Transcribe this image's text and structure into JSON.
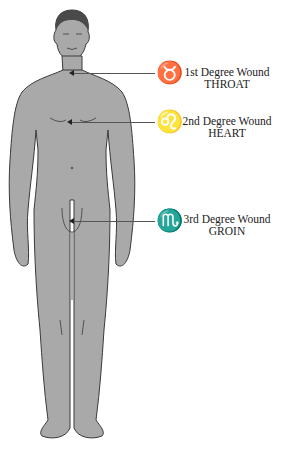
{
  "diagram": {
    "type": "anatomical-figure",
    "figure": "standing male human body, front view",
    "colors": {
      "body_fill": "#a9a9a9",
      "outline": "#3a3a3a",
      "hair": "#4a4a4a",
      "pointer_line": "#555555",
      "text": "#222222"
    },
    "annotations": [
      {
        "id": "throat",
        "symbol": "♉",
        "symbol_name": "taurus",
        "line1": "1st Degree Wound",
        "line2": "THROAT",
        "pointer_y": 73
      },
      {
        "id": "heart",
        "symbol": "♌",
        "symbol_name": "leo",
        "line1": "2nd Degree Wound",
        "line2": "HEART",
        "pointer_y": 122
      },
      {
        "id": "groin",
        "symbol": "♏",
        "symbol_name": "scorpio",
        "line1": "3rd Degree Wound",
        "line2": "GROIN",
        "pointer_y": 221
      }
    ]
  }
}
